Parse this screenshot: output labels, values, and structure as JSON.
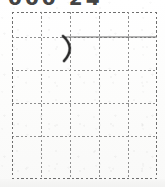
{
  "image": {
    "kind": "scanned-handwriting-practice-sheet",
    "width": 165,
    "height": 187,
    "background_color": "#fdfdfc"
  },
  "header": {
    "cropped_text": "000 24",
    "note_label": "cropped-header-text"
  },
  "grid": {
    "label": "practice-grid",
    "columns": 5,
    "rows": 5,
    "left": 12,
    "top": 12,
    "width": 145,
    "height": 166,
    "cell_width": 29,
    "cell_height": 33.2,
    "line_style": "dotted",
    "line_color": "#8f8f8f",
    "border_color": "#6e6e6e",
    "column_x": [
      0,
      29,
      58,
      87,
      116,
      145
    ],
    "row_y": [
      0,
      24.8,
      58,
      91.2,
      124.4,
      166
    ]
  },
  "marks": [
    {
      "name": "handwritten-paren-stroke",
      "type": "curve",
      "description": "closing-parenthesis stroke",
      "color": "#2a2a2a",
      "start": [
        63,
        36
      ],
      "end": [
        64,
        61
      ],
      "control": [
        76,
        48
      ]
    },
    {
      "name": "horizontal-rule-stroke",
      "type": "line",
      "description": "straight horizontal ruled line",
      "color": "#6a6a6a",
      "start": [
        63,
        37
      ],
      "end": [
        157,
        37
      ]
    }
  ]
}
